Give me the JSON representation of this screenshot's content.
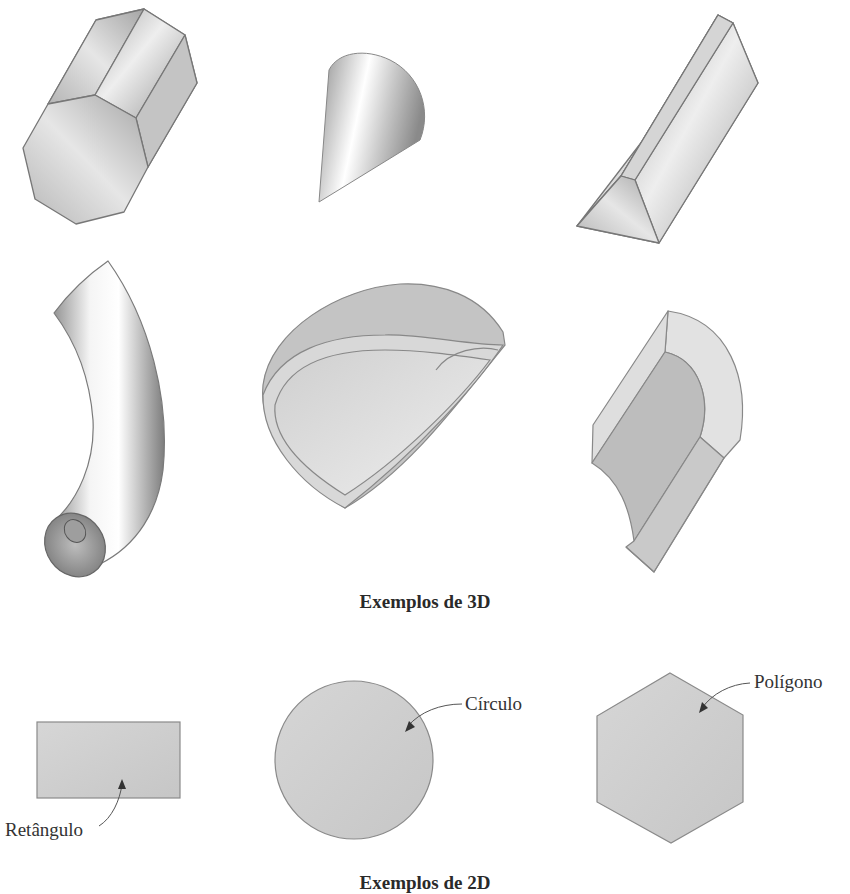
{
  "figure": {
    "section_3d": {
      "caption": "Exemplos de 3D",
      "shapes": [
        {
          "name": "octagonal-prism"
        },
        {
          "name": "cone-section"
        },
        {
          "name": "triangular-prism"
        },
        {
          "name": "curved-tube"
        },
        {
          "name": "hollow-shell-section"
        },
        {
          "name": "rounded-channel"
        }
      ]
    },
    "section_2d": {
      "caption": "Exemplos de 2D",
      "shapes": [
        {
          "name": "rectangle",
          "label": "Retângulo"
        },
        {
          "name": "circle",
          "label": "Círculo"
        },
        {
          "name": "polygon",
          "label": "Polígono"
        }
      ]
    },
    "colors": {
      "fill_light": "#dcdcdc",
      "fill_mid": "#bdbdbd",
      "fill_dark": "#8f8f8f",
      "stroke": "#7a7a7a",
      "text": "#333333"
    }
  }
}
